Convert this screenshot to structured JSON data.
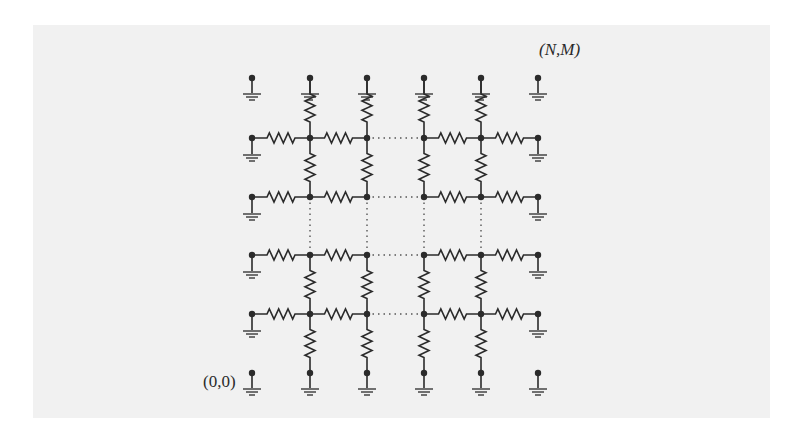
{
  "diagram": {
    "type": "resistor-lattice",
    "labels": {
      "top_right_corner": "(N,M)",
      "bottom_left_corner": "(0,0)"
    },
    "grid": {
      "interior_columns_shown": 4,
      "interior_rows_shown": 4,
      "column_groups": [
        [
          1,
          2
        ],
        [
          3,
          4
        ]
      ],
      "row_groups": [
        [
          1,
          2
        ],
        [
          3,
          4
        ]
      ],
      "elided_between_groups": "dotted lines",
      "boundary": "each boundary node connected to ground",
      "corner_nodes": "grounded, unconnected"
    },
    "colors": {
      "line": "#2b2b2b",
      "background": "#f1f1f1",
      "page": "#ffffff"
    }
  }
}
